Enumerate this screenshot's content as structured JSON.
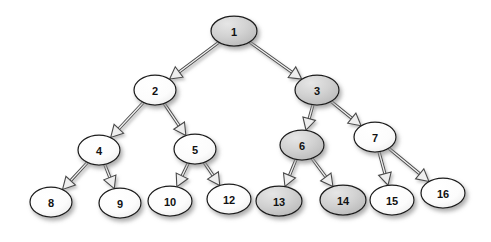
{
  "diagram": {
    "type": "binary-tree",
    "background_color": "#ffffff",
    "node_shape": "ellipse",
    "edge_style": "3d-outlined-arrow",
    "node_fill_plain": "#fdfdfd",
    "node_fill_highlight": "#c9c9c9",
    "node_stroke_color": "#1c1c1c",
    "edge_stroke_color": "#4a4a4a",
    "label_color": "#111111",
    "nodes": [
      {
        "id": "n1",
        "label": "1",
        "cx": 234,
        "cy": 31,
        "rx": 23,
        "ry": 15,
        "highlighted": true,
        "level": 0
      },
      {
        "id": "n2",
        "label": "2",
        "cx": 155,
        "cy": 90,
        "rx": 21,
        "ry": 15,
        "highlighted": false,
        "level": 1
      },
      {
        "id": "n3",
        "label": "3",
        "cx": 317,
        "cy": 90,
        "rx": 22,
        "ry": 15,
        "highlighted": true,
        "level": 1
      },
      {
        "id": "n4",
        "label": "4",
        "cx": 99,
        "cy": 150,
        "rx": 21,
        "ry": 15,
        "highlighted": false,
        "level": 2
      },
      {
        "id": "n5",
        "label": "5",
        "cx": 195,
        "cy": 149,
        "rx": 21,
        "ry": 15,
        "highlighted": false,
        "level": 2
      },
      {
        "id": "n6",
        "label": "6",
        "cx": 302,
        "cy": 145,
        "rx": 22,
        "ry": 15,
        "highlighted": true,
        "level": 2
      },
      {
        "id": "n7",
        "label": "7",
        "cx": 375,
        "cy": 137,
        "rx": 21,
        "ry": 15,
        "highlighted": false,
        "level": 2
      },
      {
        "id": "n8",
        "label": "8",
        "cx": 51,
        "cy": 202,
        "rx": 21,
        "ry": 15,
        "highlighted": false,
        "level": 3
      },
      {
        "id": "n9",
        "label": "9",
        "cx": 120,
        "cy": 203,
        "rx": 21,
        "ry": 15,
        "highlighted": false,
        "level": 3
      },
      {
        "id": "n10",
        "label": "10",
        "cx": 170,
        "cy": 201,
        "rx": 22,
        "ry": 15,
        "highlighted": false,
        "level": 3
      },
      {
        "id": "n12",
        "label": "12",
        "cx": 229,
        "cy": 199,
        "rx": 22,
        "ry": 15,
        "highlighted": false,
        "level": 3
      },
      {
        "id": "n13",
        "label": "13",
        "cx": 279,
        "cy": 201,
        "rx": 23,
        "ry": 15,
        "highlighted": true,
        "level": 3
      },
      {
        "id": "n14",
        "label": "14",
        "cx": 343,
        "cy": 200,
        "rx": 23,
        "ry": 15,
        "highlighted": true,
        "level": 3
      },
      {
        "id": "n15",
        "label": "15",
        "cx": 392,
        "cy": 200,
        "rx": 22,
        "ry": 15,
        "highlighted": false,
        "level": 3
      },
      {
        "id": "n16",
        "label": "16",
        "cx": 443,
        "cy": 193,
        "rx": 22,
        "ry": 15,
        "highlighted": false,
        "level": 3
      }
    ],
    "edges": [
      {
        "id": "e1-2",
        "from": "n1",
        "to": "n2",
        "label": ""
      },
      {
        "id": "e1-3",
        "from": "n1",
        "to": "n3",
        "label": ""
      },
      {
        "id": "e2-4",
        "from": "n2",
        "to": "n4",
        "label": ""
      },
      {
        "id": "e2-5",
        "from": "n2",
        "to": "n5",
        "label": ""
      },
      {
        "id": "e3-6",
        "from": "n3",
        "to": "n6",
        "label": ""
      },
      {
        "id": "e3-7",
        "from": "n3",
        "to": "n7",
        "label": ""
      },
      {
        "id": "e4-8",
        "from": "n4",
        "to": "n8",
        "label": ""
      },
      {
        "id": "e4-9",
        "from": "n4",
        "to": "n9",
        "label": ""
      },
      {
        "id": "e5-10",
        "from": "n5",
        "to": "n10",
        "label": ""
      },
      {
        "id": "e5-12",
        "from": "n5",
        "to": "n12",
        "label": ""
      },
      {
        "id": "e6-13",
        "from": "n6",
        "to": "n13",
        "label": ""
      },
      {
        "id": "e6-14",
        "from": "n6",
        "to": "n14",
        "label": ""
      },
      {
        "id": "e7-15",
        "from": "n7",
        "to": "n15",
        "label": ""
      },
      {
        "id": "e7-16",
        "from": "n7",
        "to": "n16",
        "label": ""
      }
    ]
  }
}
